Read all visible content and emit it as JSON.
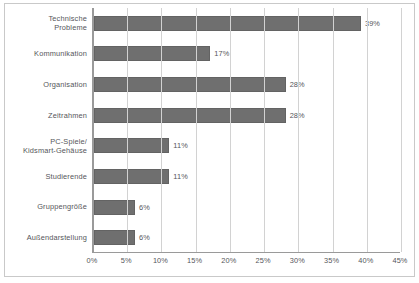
{
  "chart_data": {
    "type": "bar",
    "orientation": "horizontal",
    "title": "",
    "subtitle": "",
    "xlabel": "",
    "ylabel": "",
    "categories": [
      "Technische\nProbleme",
      "Kommunikation",
      "Organisation",
      "Zeitrahmen",
      "PC-Spiele/\nKidsmart-Gehäuse",
      "Studierende",
      "Gruppengröße",
      "Außendarstellung"
    ],
    "values": [
      39,
      17,
      28,
      28,
      11,
      11,
      6,
      6
    ],
    "data_labels": [
      "39%",
      "17%",
      "28%",
      "28%",
      "11%",
      "11%",
      "6%",
      "6%"
    ],
    "xlim": [
      0,
      45
    ],
    "xticks": [
      0,
      5,
      10,
      15,
      20,
      25,
      30,
      35,
      40,
      45
    ],
    "xtick_labels": [
      "0%",
      "5%",
      "10%",
      "15%",
      "20%",
      "25%",
      "30%",
      "35%",
      "40%",
      "45%"
    ],
    "grid": "vertical",
    "legend": "none",
    "bar_color": "#6f6f6f",
    "grid_color": "#d2d2d2",
    "axis_color": "#9a9a9a",
    "text_color": "#55565a"
  }
}
